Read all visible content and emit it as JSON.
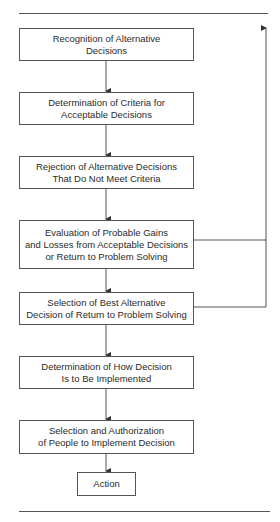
{
  "diagram": {
    "type": "flowchart",
    "steps": [
      {
        "id": "recognition",
        "label": "Recognition of Alternative\nDecisions"
      },
      {
        "id": "criteria",
        "label": "Determination of Criteria for\nAcceptable Decisions"
      },
      {
        "id": "rejection",
        "label": "Rejection of Alternative Decisions\nThat Do Not Meet Criteria"
      },
      {
        "id": "evaluation",
        "label": "Evaluation of Probable Gains\nand Losses from Acceptable Decisions\nor Return to Problem Solving"
      },
      {
        "id": "selection",
        "label": "Selection of Best Alternative\nDecision of Return to Problem Solving"
      },
      {
        "id": "implementation",
        "label": "Determination of How Decision\nIs to Be Implemented"
      },
      {
        "id": "authorization",
        "label": "Selection and Authorization\nof People to Implement Decision"
      },
      {
        "id": "action",
        "label": "Action"
      }
    ],
    "edges": [
      {
        "from": "recognition",
        "to": "criteria"
      },
      {
        "from": "criteria",
        "to": "rejection"
      },
      {
        "from": "rejection",
        "to": "evaluation"
      },
      {
        "from": "evaluation",
        "to": "selection"
      },
      {
        "from": "selection",
        "to": "implementation"
      },
      {
        "from": "implementation",
        "to": "authorization"
      },
      {
        "from": "authorization",
        "to": "action"
      },
      {
        "from": "evaluation",
        "to": "return-loop",
        "note": "feedback line upward"
      },
      {
        "from": "selection",
        "to": "return-loop",
        "note": "feedback line upward"
      }
    ],
    "colors": {
      "line": "#555555",
      "text": "#2a2a2a",
      "background": "#ffffff"
    }
  }
}
